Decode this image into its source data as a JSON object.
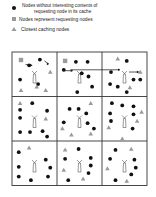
{
  "legend": {
    "items": [
      {
        "icon": "black-circle-node-icon",
        "line1": "Nodes without interesting contents of",
        "line2": "requesting node in its cache"
      },
      {
        "icon": "gray-square-requesting-node-icon",
        "line1": "Nodes represent requesting nodes"
      },
      {
        "icon": "gray-triangle-caching-node-icon",
        "line1": "Closest caching nodes"
      }
    ]
  },
  "colors": {
    "node": "#111111",
    "requesting": "#9a9a9a",
    "caching": "#9a9a9a",
    "grid": "#333333",
    "tower": "#555555"
  },
  "grid": {
    "rows": 3,
    "cols": 3,
    "cells": [
      {
        "nodes": [
          [
            0.62,
            0.17
          ],
          [
            0.58,
            0.72
          ],
          [
            0.18,
            0.62
          ],
          [
            0.38,
            0.3
          ]
        ],
        "tris": [
          [
            0.85,
            0.45
          ],
          [
            0.55,
            0.78
          ],
          [
            0.2,
            0.86
          ],
          [
            0.75,
            0.86
          ]
        ],
        "squares": [
          [
            0.2,
            0.18
          ]
        ],
        "arrows": [
          [
            [
              0.3,
              0.28
            ],
            [
              0.45,
              0.3
            ]
          ],
          [
            [
              0.72,
              0.2
            ],
            [
              0.82,
              0.27
            ]
          ]
        ]
      },
      {
        "nodes": [
          [
            0.42,
            0.22
          ],
          [
            0.68,
            0.22
          ],
          [
            0.55,
            0.48
          ],
          [
            0.7,
            0.55
          ],
          [
            0.78,
            0.78
          ],
          [
            0.45,
            0.9
          ],
          [
            0.15,
            0.4
          ]
        ],
        "tris": [],
        "squares": [
          [
            0.18,
            0.2
          ]
        ],
        "arrows": [
          [
            [
              0.15,
              0.42
            ],
            [
              0.35,
              0.42
            ]
          ],
          [
            [
              0.3,
              0.4
            ],
            [
              1.4,
              0.4
            ]
          ]
        ]
      },
      {
        "nodes": [
          [
            0.55,
            0.2
          ],
          [
            0.2,
            0.45
          ],
          [
            0.85,
            0.62
          ],
          [
            0.7,
            0.62
          ],
          [
            0.18,
            0.72
          ],
          [
            0.35,
            0.78
          ],
          [
            0.55,
            0.9
          ]
        ],
        "tris": [
          [
            0.35,
            0.15
          ],
          [
            0.85,
            0.45
          ],
          [
            0.62,
            0.8
          ]
        ],
        "squares": [],
        "arrows": [
          [
            [
              0.6,
              0.45
            ],
            [
              0.82,
              0.45
            ]
          ]
        ]
      },
      {
        "nodes": [
          [
            0.45,
            0.15
          ],
          [
            0.18,
            0.3
          ],
          [
            0.18,
            0.48
          ],
          [
            0.78,
            0.32
          ],
          [
            0.18,
            0.8
          ],
          [
            0.4,
            0.8
          ],
          [
            0.68,
            0.78
          ],
          [
            0.78,
            0.9
          ]
        ],
        "tris": [
          [
            0.18,
            0.15
          ],
          [
            0.75,
            0.5
          ]
        ],
        "squares": [],
        "arrows": []
      },
      {
        "nodes": [
          [
            0.28,
            0.28
          ],
          [
            0.48,
            0.28
          ],
          [
            0.65,
            0.38
          ],
          [
            0.15,
            0.58
          ],
          [
            0.68,
            0.6
          ],
          [
            0.82,
            0.72
          ]
        ],
        "tris": [
          [
            0.75,
            0.15
          ],
          [
            0.12,
            0.72
          ],
          [
            0.32,
            0.86
          ],
          [
            0.75,
            0.84
          ]
        ],
        "squares": [],
        "arrows": []
      },
      {
        "nodes": [
          [
            0.22,
            0.15
          ],
          [
            0.45,
            0.2
          ],
          [
            0.7,
            0.22
          ],
          [
            0.18,
            0.38
          ],
          [
            0.7,
            0.4
          ],
          [
            0.2,
            0.55
          ],
          [
            0.68,
            0.72
          ]
        ],
        "tris": [
          [
            0.88,
            0.35
          ],
          [
            0.78,
            0.55
          ],
          [
            0.15,
            0.7
          ],
          [
            0.45,
            0.95
          ]
        ],
        "squares": [],
        "arrows": []
      },
      {
        "nodes": [
          [
            0.15,
            0.25
          ],
          [
            0.75,
            0.42
          ],
          [
            0.15,
            0.58
          ],
          [
            0.85,
            0.6
          ],
          [
            0.15,
            0.8
          ],
          [
            0.8,
            0.8
          ],
          [
            0.42,
            0.88
          ]
        ],
        "tris": [
          [
            0.38,
            0.15
          ]
        ],
        "squares": [],
        "arrows": []
      },
      {
        "nodes": [
          [
            0.48,
            0.18
          ],
          [
            0.18,
            0.4
          ],
          [
            0.75,
            0.38
          ],
          [
            0.75,
            0.55
          ],
          [
            0.7,
            0.72
          ],
          [
            0.25,
            0.88
          ]
        ],
        "tris": [
          [
            0.18,
            0.2
          ],
          [
            0.15,
            0.65
          ],
          [
            0.58,
            0.85
          ]
        ],
        "squares": [],
        "arrows": []
      },
      {
        "nodes": [
          [
            0.3,
            0.2
          ],
          [
            0.18,
            0.4
          ],
          [
            0.72,
            0.42
          ],
          [
            0.75,
            0.6
          ],
          [
            0.65,
            0.75
          ],
          [
            0.3,
            0.88
          ]
        ],
        "tris": [
          [
            0.65,
            0.18
          ],
          [
            0.12,
            0.62
          ],
          [
            0.55,
            0.9
          ]
        ],
        "squares": [],
        "arrows": []
      }
    ]
  }
}
